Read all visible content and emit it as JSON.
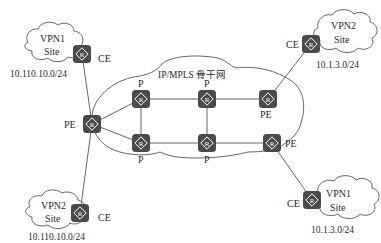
{
  "diagram": {
    "backbone": {
      "label": "IP/MPLS 骨干网"
    },
    "nodes": [
      {
        "id": "ce-vpn1-left",
        "role": "CE",
        "label": "CE",
        "icon": "router-icon"
      },
      {
        "id": "pe-left",
        "role": "PE",
        "label": "PE",
        "icon": "router-icon"
      },
      {
        "id": "p-top-left",
        "role": "P",
        "label": "P",
        "icon": "router-icon"
      },
      {
        "id": "p-top-mid",
        "role": "P",
        "label": "P",
        "icon": "router-icon"
      },
      {
        "id": "pe-top-right",
        "role": "PE",
        "label": "PE",
        "icon": "router-icon"
      },
      {
        "id": "p-bot-left",
        "role": "P",
        "label": "P",
        "icon": "router-icon"
      },
      {
        "id": "p-bot-mid",
        "role": "P",
        "label": "P",
        "icon": "router-icon"
      },
      {
        "id": "pe-bot-right",
        "role": "PE",
        "label": "PE",
        "icon": "router-icon"
      },
      {
        "id": "ce-vpn2-right",
        "role": "CE",
        "label": "CE",
        "icon": "router-icon"
      },
      {
        "id": "ce-vpn2-left",
        "role": "CE",
        "label": "CE",
        "icon": "router-icon"
      },
      {
        "id": "ce-vpn1-right",
        "role": "CE",
        "label": "CE",
        "icon": "router-icon"
      }
    ],
    "sites": [
      {
        "id": "site-vpn1-left",
        "line1": "VPN1",
        "line2": "Site",
        "subnet": "10.110.10.0/24"
      },
      {
        "id": "site-vpn2-right",
        "line1": "VPN2",
        "line2": "Site",
        "subnet": "10.1.3.0/24"
      },
      {
        "id": "site-vpn2-left",
        "line1": "VPN2",
        "line2": "Site",
        "subnet": "10.110.10.0/24"
      },
      {
        "id": "site-vpn1-right",
        "line1": "VPN1",
        "line2": "Site",
        "subnet": "10.1.3.0/24"
      }
    ],
    "links": [
      [
        "ce-vpn1-left",
        "pe-left"
      ],
      [
        "ce-vpn2-left",
        "pe-left"
      ],
      [
        "pe-left",
        "p-top-left"
      ],
      [
        "pe-left",
        "p-bot-left"
      ],
      [
        "p-top-left",
        "p-top-mid"
      ],
      [
        "p-top-mid",
        "pe-top-right"
      ],
      [
        "p-bot-left",
        "p-bot-mid"
      ],
      [
        "p-bot-mid",
        "pe-bot-right"
      ],
      [
        "p-top-left",
        "p-bot-left"
      ],
      [
        "p-top-mid",
        "p-bot-mid"
      ],
      [
        "pe-top-right",
        "ce-vpn2-right"
      ],
      [
        "pe-bot-right",
        "ce-vpn1-right"
      ]
    ],
    "router_glyph": "R",
    "colors": {
      "router": "#4a4a4a",
      "line": "#555555",
      "text": "#2a2a2a",
      "background": "#ffffff"
    }
  }
}
